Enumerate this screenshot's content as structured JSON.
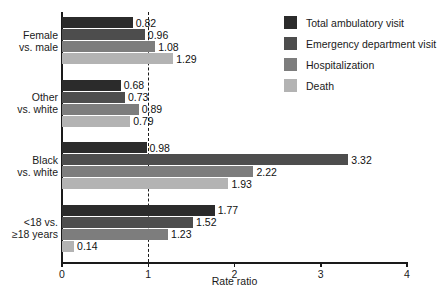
{
  "chart_data": {
    "type": "bar",
    "orientation": "horizontal",
    "title": "",
    "xlabel": "Rate ratio",
    "ylabel": "",
    "xlim": [
      0,
      4
    ],
    "xticks": [
      "0",
      "1",
      "2",
      "3",
      "4"
    ],
    "xtick_values": [
      0,
      1,
      2,
      3,
      4
    ],
    "grid": false,
    "reference_line": 1,
    "legend_position": "top-right",
    "categories": [
      "Female\nvs. male",
      "Other\nvs. white",
      "Black\nvs. white",
      "<18 vs.\n≥18 years"
    ],
    "category_lines": [
      [
        "Female",
        "vs. male"
      ],
      [
        "Other",
        "vs. white"
      ],
      [
        "Black",
        "vs. white"
      ],
      [
        "<18 vs.",
        "≥18 years"
      ]
    ],
    "series": [
      {
        "name": "Total ambulatory visit",
        "color": "#2b2b2b",
        "values": [
          0.82,
          0.68,
          0.98,
          1.77
        ],
        "labels": [
          "0.82",
          "0.68",
          "0.98",
          "1.77"
        ]
      },
      {
        "name": "Emergency department visit",
        "color": "#4d4d4d",
        "values": [
          0.96,
          0.73,
          3.32,
          1.52
        ],
        "labels": [
          "0.96",
          "0.73",
          "3.32",
          "1.52"
        ]
      },
      {
        "name": "Hospitalization",
        "color": "#7d7d7d",
        "values": [
          1.08,
          0.89,
          2.22,
          1.23
        ],
        "labels": [
          "1.08",
          "0.89",
          "2.22",
          "1.23"
        ]
      },
      {
        "name": "Death",
        "color": "#b3b3b3",
        "values": [
          1.29,
          0.79,
          1.93,
          0.14
        ],
        "labels": [
          "1.29",
          "0.79",
          "1.93",
          "0.14"
        ]
      }
    ]
  },
  "legend": {
    "items": [
      {
        "label": "Total ambulatory visit",
        "color": "#2b2b2b"
      },
      {
        "label": "Emergency department visit",
        "color": "#4d4d4d"
      },
      {
        "label": "Hospitalization",
        "color": "#7d7d7d"
      },
      {
        "label": "Death",
        "color": "#b3b3b3"
      }
    ]
  },
  "axis": {
    "x_title": "Rate ratio"
  }
}
